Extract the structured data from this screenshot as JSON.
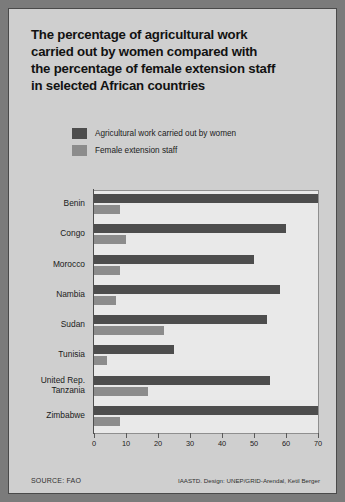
{
  "title": {
    "line1": "The percentage of agricultural work",
    "line2": "carried out by women compared with",
    "line3": "the percentage of female extension staff",
    "line4": "in selected African countries"
  },
  "legend": [
    {
      "label": "Agricultural work carried out by women",
      "color": "#4d4d4d"
    },
    {
      "label": "Female extension staff",
      "color": "#8c8c8c"
    }
  ],
  "footer": {
    "source": "SOURCE: FAO",
    "credit": "IAASTD. Design: UNEP/GRID-Arendal, Ketil Berger"
  },
  "chart_data": {
    "type": "bar",
    "orientation": "horizontal",
    "title": "The percentage of agricultural work carried out by women compared with the percentage of female extension staff in selected African countries",
    "xlabel": "",
    "ylabel": "",
    "xlim": [
      0,
      70
    ],
    "xticks": [
      0,
      10,
      20,
      30,
      40,
      50,
      60,
      70
    ],
    "grid": false,
    "legend_position": "top-left",
    "categories": [
      "Benin",
      "Congo",
      "Morocco",
      "Nambia",
      "Sudan",
      "Tunisia",
      "United Rep.\nTanzania",
      "Zimbabwe"
    ],
    "series": [
      {
        "name": "Agricultural work carried out by women",
        "color": "#4d4d4d",
        "values": [
          70,
          60,
          50,
          58,
          54,
          25,
          55,
          70
        ]
      },
      {
        "name": "Female extension staff",
        "color": "#8c8c8c",
        "values": [
          8,
          10,
          8,
          7,
          22,
          4,
          17,
          8
        ]
      }
    ]
  }
}
